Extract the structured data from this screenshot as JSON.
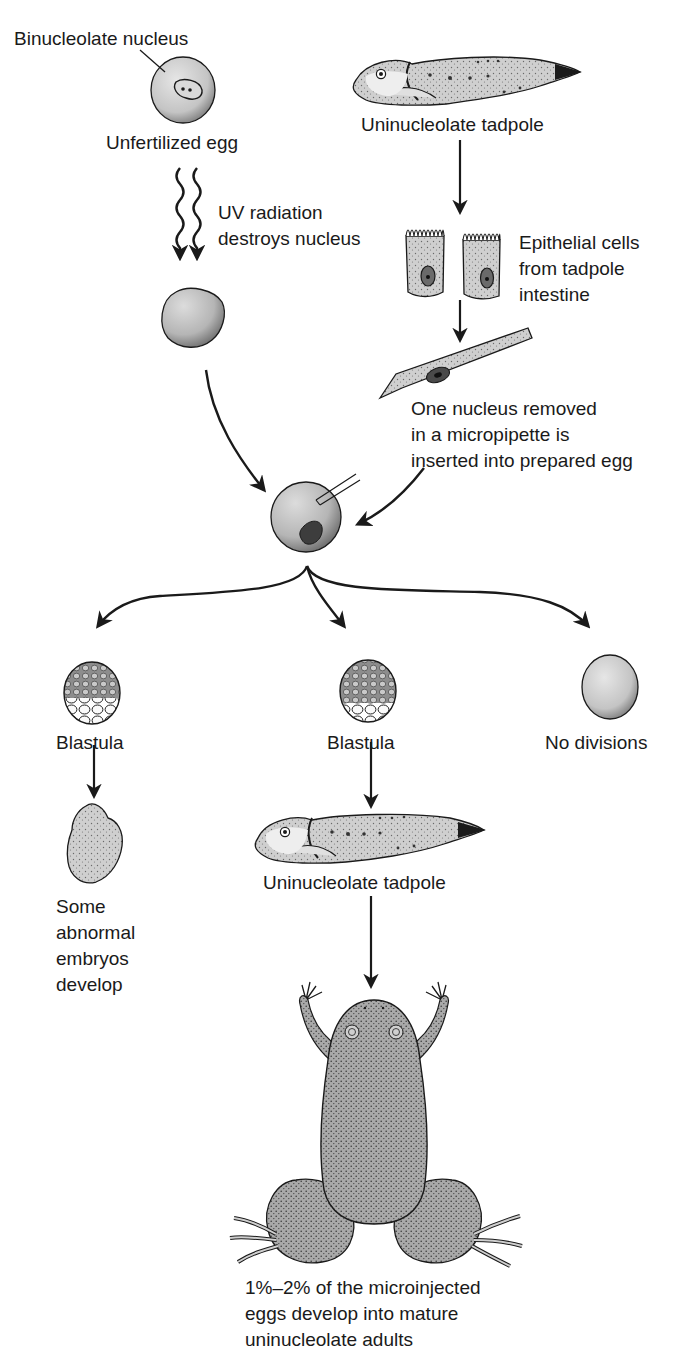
{
  "diagram": {
    "type": "process-flow",
    "labels": {
      "binucleolate_nucleus": "Binucleolate nucleus",
      "unfertilized_egg": "Unfertilized egg",
      "uv_radiation": "UV radiation\ndestroys nucleus",
      "uninucleolate_tadpole_top": "Uninucleolate tadpole",
      "epithelial_cells": "Epithelial cells\nfrom tadpole\nintestine",
      "nucleus_removed": "One nucleus removed\nin a micropipette is\ninserted into prepared egg",
      "blastula_left": "Blastula",
      "blastula_middle": "Blastula",
      "no_divisions": "No divisions",
      "abnormal_embryos": "Some\nabnormal\nembryos\ndevelop",
      "uninucleolate_tadpole_bottom": "Uninucleolate tadpole",
      "outcome_caption": "1%–2% of the microinjected\neggs develop into mature\nuninucleolate adults"
    },
    "nodes": [
      {
        "id": "unfertilized-egg",
        "label": "Unfertilized egg"
      },
      {
        "id": "enucleated-egg",
        "label": ""
      },
      {
        "id": "source-tadpole",
        "label": "Uninucleolate tadpole"
      },
      {
        "id": "epithelial-cells",
        "label": "Epithelial cells from tadpole intestine"
      },
      {
        "id": "micropipette",
        "label": "One nucleus removed in a micropipette is inserted into prepared egg"
      },
      {
        "id": "injected-egg",
        "label": ""
      },
      {
        "id": "blastula-left",
        "label": "Blastula"
      },
      {
        "id": "blastula-middle",
        "label": "Blastula"
      },
      {
        "id": "no-divisions",
        "label": "No divisions"
      },
      {
        "id": "abnormal-embryo",
        "label": "Some abnormal embryos develop"
      },
      {
        "id": "result-tadpole",
        "label": "Uninucleolate tadpole"
      },
      {
        "id": "adult-frog",
        "label": "1%–2% of the microinjected eggs develop into mature uninucleolate adults"
      }
    ],
    "edges": [
      {
        "from": "unfertilized-egg",
        "to": "enucleated-egg",
        "style": "wavy-uv"
      },
      {
        "from": "source-tadpole",
        "to": "epithelial-cells"
      },
      {
        "from": "epithelial-cells",
        "to": "micropipette"
      },
      {
        "from": "enucleated-egg",
        "to": "injected-egg"
      },
      {
        "from": "micropipette",
        "to": "injected-egg"
      },
      {
        "from": "injected-egg",
        "to": "blastula-left"
      },
      {
        "from": "injected-egg",
        "to": "blastula-middle"
      },
      {
        "from": "injected-egg",
        "to": "no-divisions"
      },
      {
        "from": "blastula-left",
        "to": "abnormal-embryo"
      },
      {
        "from": "blastula-middle",
        "to": "result-tadpole"
      },
      {
        "from": "result-tadpole",
        "to": "adult-frog"
      }
    ],
    "colors": {
      "ink": "#1a1a1a",
      "fill_light": "#d8d8d8",
      "fill_mid": "#bdbdbd",
      "background": "#ffffff"
    }
  }
}
